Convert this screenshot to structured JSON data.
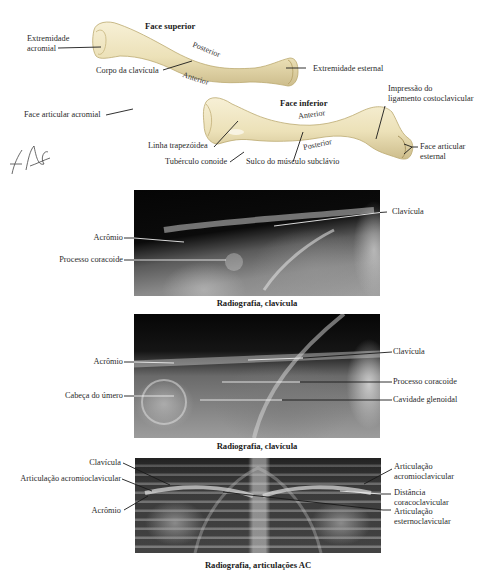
{
  "illustration": {
    "superior_view": {
      "title": "Face superior",
      "labels": {
        "acromial_end_line1": "Extremidade",
        "acromial_end_line2": "acromial",
        "shaft": "Corpo da clavícula",
        "sternal_end": "Extremidade esternal",
        "posterior": "Posterior",
        "anterior": "Anterior"
      }
    },
    "inferior_view": {
      "title": "Face inferior",
      "labels": {
        "acromial_facet": "Face articular acromial",
        "trapezoid_line": "Linha trapezóidea",
        "conoid_tubercle": "Tubérculo conoide",
        "subclavian_groove": "Sulco do músculo subclávio",
        "costoclavicular_impression_line1": "Impressão do",
        "costoclavicular_impression_line2": "ligamento costoclavicular",
        "sternal_facet_line1": "Face articular",
        "sternal_facet_line2": "esternal",
        "anterior": "Anterior",
        "posterior": "Posterior"
      }
    },
    "signature": "F. Netter"
  },
  "radiographs": [
    {
      "caption": "Radiografia, clavícula",
      "labels": {
        "acromion": "Acrômio",
        "coracoid": "Processo coracoide",
        "clavicle": "Clavícula"
      }
    },
    {
      "caption": "Radiografia, clavícula",
      "labels": {
        "acromion": "Acrômio",
        "humeral_head": "Cabeça do úmero",
        "clavicle": "Clavícula",
        "coracoid": "Processo coracoide",
        "glenoid": "Cavidade glenoidal"
      }
    },
    {
      "caption": "Radiografia, articulações AC",
      "labels": {
        "clavicle": "Clavícula",
        "ac_joint_left": "Articulação acromioclavicular",
        "acromion": "Acrômio",
        "ac_joint_right_line1": "Articulação",
        "ac_joint_right_line2": "acromioclavicular",
        "cc_distance_line1": "Distância",
        "cc_distance_line2": "coracoclavicular",
        "sc_joint_line1": "Articulação",
        "sc_joint_line2": "esternoclavicular"
      }
    }
  ],
  "colors": {
    "bone": "#efe6c2",
    "bone_shadow": "#c9b98a",
    "leader_line": "#1a1a1a",
    "xray_dark": "#0b0b0b",
    "xray_light": "#d8d8d8"
  }
}
